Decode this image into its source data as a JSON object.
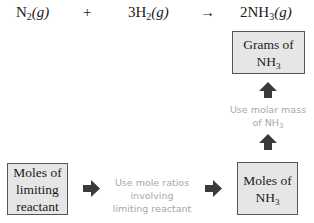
{
  "equation": {
    "reactant1": {
      "coef": "",
      "symbol": "N",
      "sub": "2",
      "state": "(g)"
    },
    "plus": "+",
    "reactant2": {
      "coef": "3",
      "symbol": "H",
      "sub": "2",
      "state": "(g)"
    },
    "arrow": "→",
    "product": {
      "coef": "2",
      "symbol": "NH",
      "sub": "3",
      "state": "(g)"
    }
  },
  "boxes": {
    "grams_nh3": {
      "line1": "Grams of",
      "line2": "NH",
      "line2_sub": "3"
    },
    "moles_nh3": {
      "line1": "Moles of",
      "line2": "NH",
      "line2_sub": "3"
    },
    "moles_limiting": {
      "line1": "Moles of",
      "line2": "limiting",
      "line3": "reactant"
    }
  },
  "notes": {
    "molar_mass": {
      "line1": "Use molar mass",
      "line2": "of NH",
      "line2_sub": "3"
    },
    "mole_ratios": {
      "line1": "Use mole ratios",
      "line2": "involving",
      "line3": "limiting reactant"
    }
  },
  "colors": {
    "box_fill": "#e6e6e6",
    "box_border": "#555555",
    "arrow": "#3a3a3a",
    "note_text": "#a8a8a8"
  }
}
